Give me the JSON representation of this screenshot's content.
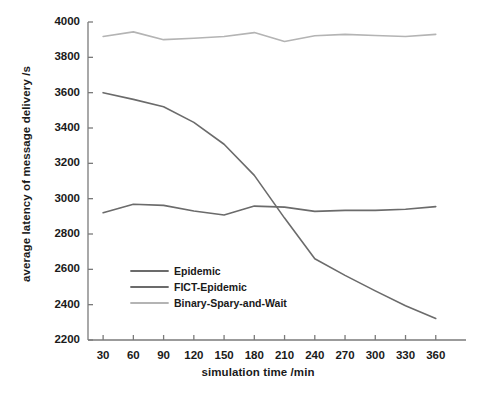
{
  "chart_data": {
    "type": "line",
    "title": "",
    "xlabel": "simulation time  /min",
    "ylabel": "average latency of message delivery /s",
    "x": [
      30,
      60,
      90,
      120,
      150,
      180,
      210,
      240,
      270,
      300,
      330,
      360
    ],
    "xlim": [
      15,
      390
    ],
    "ylim": [
      2200,
      4000
    ],
    "xticks": [
      "30",
      "60",
      "90",
      "120",
      "150",
      "180",
      "210",
      "240",
      "270",
      "300",
      "330",
      "360"
    ],
    "yticks": [
      "2200",
      "2400",
      "2600",
      "2800",
      "3000",
      "3200",
      "3400",
      "3600",
      "3800",
      "4000"
    ],
    "grid": false,
    "legend_position": "center-left",
    "series": [
      {
        "name": "Epidemic",
        "color": "#6b6b6b",
        "values": [
          2920,
          2968,
          2962,
          2930,
          2908,
          2958,
          2952,
          2928,
          2934,
          2934,
          2940,
          2955
        ]
      },
      {
        "name": "FICT-Epidemic",
        "color": "#6b6b6b",
        "values": [
          3600,
          3562,
          3520,
          3432,
          3308,
          3132,
          2890,
          2660,
          2566,
          2478,
          2394,
          2322
        ]
      },
      {
        "name": "Binary-Spary-and-Wait",
        "color": "#b4b4b4",
        "values": [
          3918,
          3944,
          3900,
          3908,
          3918,
          3940,
          3890,
          3922,
          3930,
          3924,
          3918,
          3930
        ]
      }
    ]
  },
  "legend": {
    "items": [
      {
        "label": "Epidemic"
      },
      {
        "label": "FICT-Epidemic"
      },
      {
        "label": "Binary-Spary-and-Wait"
      }
    ]
  },
  "axes": {
    "x_title": "simulation time  /min",
    "y_title": "average latency of message delivery /s"
  }
}
